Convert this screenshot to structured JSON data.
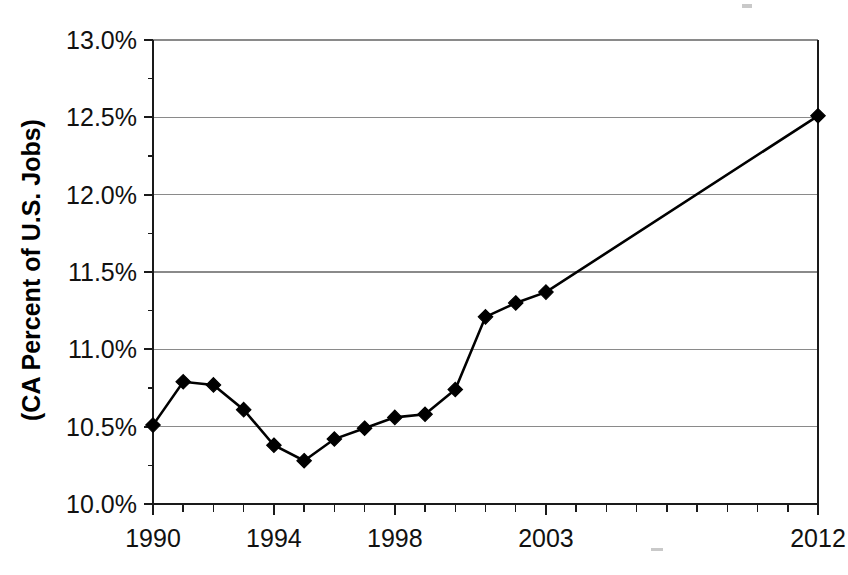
{
  "chart_data": {
    "type": "line",
    "title": "",
    "subtitle": "",
    "xlabel": "",
    "ylabel": "(CA Percent of U.S. Jobs)",
    "x": [
      1990,
      1991,
      1992,
      1993,
      1994,
      1995,
      1996,
      1997,
      1998,
      1999,
      2000,
      2001,
      2002,
      2003,
      2012
    ],
    "values": [
      10.51,
      10.79,
      10.77,
      10.61,
      10.38,
      10.28,
      10.42,
      10.49,
      10.56,
      10.58,
      10.74,
      11.21,
      11.3,
      11.37,
      12.51
    ],
    "series": [
      {
        "name": "CA Percent of U.S. Jobs",
        "values": [
          10.51,
          10.79,
          10.77,
          10.61,
          10.38,
          10.28,
          10.42,
          10.49,
          10.56,
          10.58,
          10.74,
          11.21,
          11.3,
          11.37,
          12.51
        ]
      }
    ],
    "xlim": [
      1990,
      2012
    ],
    "ylim": [
      10.0,
      13.0
    ],
    "y_ticks": [
      10.0,
      10.5,
      11.0,
      11.5,
      12.0,
      12.5,
      13.0
    ],
    "y_tick_labels": [
      "10.0%",
      "10.5%",
      "11.0%",
      "11.5%",
      "12.0%",
      "12.5%",
      "13.0%"
    ],
    "x_ticks": [
      1990,
      1991,
      1992,
      1993,
      1994,
      1995,
      1996,
      1997,
      1998,
      1999,
      2000,
      2001,
      2002,
      2003,
      2004,
      2005,
      2006,
      2007,
      2008,
      2009,
      2010,
      2011,
      2012
    ],
    "x_tick_labels_shown": [
      {
        "value": 1990,
        "label": "1990"
      },
      {
        "value": 1994,
        "label": "1994"
      },
      {
        "value": 1998,
        "label": "1998"
      },
      {
        "value": 2003,
        "label": "2003"
      },
      {
        "value": 2012,
        "label": "2012"
      }
    ],
    "grid": {
      "horizontal": true,
      "vertical": false
    },
    "legend": {
      "visible": false,
      "position": "none"
    },
    "marker": "diamond",
    "line_color": "#000000",
    "marker_color": "#000000",
    "grid_color": "#8a8a8a",
    "background_color": "#ffffff"
  },
  "axis": {
    "y_title": "(CA Percent of U.S. Jobs)"
  }
}
